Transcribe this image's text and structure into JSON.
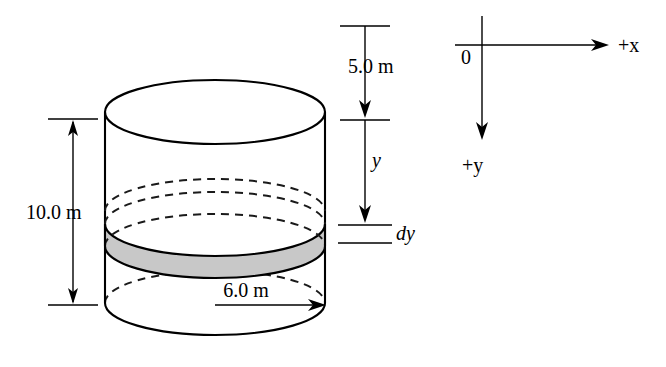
{
  "figure": {
    "colors": {
      "stroke": "#000000",
      "disk_fill": "#c8c8c8",
      "background": "#ffffff"
    }
  },
  "cylinder": {
    "name": "vertical-cylinder",
    "height_label": "10.0 m",
    "radius_label": "6.0 m"
  },
  "disk_element": {
    "name": "shaded-disk-element",
    "thickness_label": "dy"
  },
  "dimensions": {
    "height": {
      "label": "10.0 m",
      "orientation": "vertical",
      "arrow": "double"
    },
    "radius": {
      "label": "6.0 m",
      "orientation": "horizontal",
      "arrow": "single-right"
    },
    "depth_top": {
      "label": "5.0 m",
      "orientation": "vertical",
      "arrow": "single-down"
    },
    "depth_y": {
      "label": "y",
      "orientation": "vertical",
      "arrow": "single-down"
    },
    "thickness": {
      "label": "dy",
      "orientation": "vertical",
      "arrow": "none"
    }
  },
  "axes": {
    "origin_label": "0",
    "x_axis_label": "+x",
    "y_axis_label": "+y",
    "x_direction": "right",
    "y_direction": "down"
  }
}
